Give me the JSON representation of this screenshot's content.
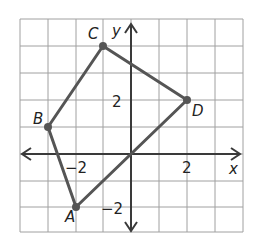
{
  "diagram": {
    "type": "coordinate-plane-quadrilateral",
    "axes": {
      "x_label": "x",
      "y_label": "y",
      "x_range": [
        -4,
        4
      ],
      "y_range": [
        -3,
        5
      ]
    },
    "ticks": {
      "x_neg": "−2",
      "x_pos": "2",
      "y_pos": "2",
      "y_neg": "−2"
    },
    "points": [
      {
        "label": "A",
        "x": -2,
        "y": -2
      },
      {
        "label": "B",
        "x": -3,
        "y": 1
      },
      {
        "label": "C",
        "x": -1,
        "y": 4
      },
      {
        "label": "D",
        "x": 2,
        "y": 2
      }
    ],
    "colors": {
      "grid": "#9a9a9a",
      "axis": "#3a3a3a",
      "shape": "#555555",
      "point": "#555555"
    }
  }
}
